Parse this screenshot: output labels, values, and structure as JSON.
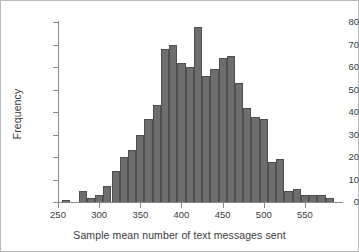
{
  "chart_data": {
    "type": "bar",
    "title": "",
    "subtitle": "",
    "xlabel": "Sample mean number of text messages sent",
    "ylabel": "Frequency",
    "grid": false,
    "legend": null,
    "bin_width": 10,
    "xlim": [
      250,
      595
    ],
    "ylim": [
      0,
      80
    ],
    "x_ticks": [
      250,
      300,
      350,
      400,
      450,
      500,
      550
    ],
    "x_tick_labels": [
      "250",
      "300",
      "350",
      "400",
      "450",
      "500",
      "550"
    ],
    "y_ticks": [
      0,
      10,
      20,
      30,
      40,
      50,
      60,
      70,
      80
    ],
    "y_tick_labels": [
      "0",
      "10",
      "20",
      "30",
      "40",
      "50",
      "60",
      "70",
      "80"
    ],
    "bin_starts": [
      255,
      265,
      275,
      285,
      295,
      305,
      315,
      325,
      335,
      345,
      355,
      365,
      375,
      385,
      395,
      405,
      415,
      425,
      435,
      445,
      455,
      465,
      475,
      485,
      495,
      505,
      515,
      525,
      535,
      545,
      555,
      565,
      575
    ],
    "categories": [
      "255-265",
      "265-275",
      "275-285",
      "285-295",
      "295-305",
      "305-315",
      "315-325",
      "325-335",
      "335-345",
      "345-355",
      "355-365",
      "365-375",
      "375-385",
      "385-395",
      "395-405",
      "405-415",
      "415-425",
      "425-435",
      "435-445",
      "445-455",
      "455-465",
      "465-475",
      "475-485",
      "485-495",
      "495-505",
      "505-515",
      "515-525",
      "525-535",
      "535-545",
      "545-555",
      "555-565",
      "565-575",
      "575-585"
    ],
    "values": [
      1,
      0,
      5,
      2,
      3,
      7,
      14,
      20,
      23,
      30,
      37,
      43,
      68,
      70,
      62,
      60,
      78,
      56,
      59,
      64,
      65,
      53,
      42,
      38,
      37,
      18,
      19,
      5,
      6,
      3,
      3,
      3,
      2
    ]
  }
}
